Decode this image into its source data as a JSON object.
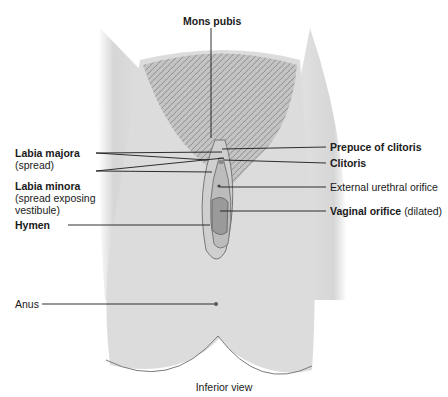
{
  "figure": {
    "view_caption": "Inferior view",
    "colors": {
      "skin": "#dcdcdc",
      "skin_shadow": "#bdbdbd",
      "hair": "#8a8a8a",
      "outline": "#6a6a6a",
      "leader_line": "#1a1a1a"
    },
    "labels": {
      "mons_pubis": "Mons pubis",
      "labia_majora": "Labia majora",
      "labia_majora_note": "(spread)",
      "labia_minora": "Labia minora",
      "labia_minora_note_1": "(spread exposing",
      "labia_minora_note_2": "vestibule)",
      "hymen": "Hymen",
      "prepuce_of_clitoris": "Prepuce of clitoris",
      "clitoris": "Clitoris",
      "external_urethral_orifice": "External urethral orifice",
      "vaginal_orifice": "Vaginal orifice",
      "vaginal_orifice_note": "(dilated)",
      "anus": "Anus"
    }
  }
}
